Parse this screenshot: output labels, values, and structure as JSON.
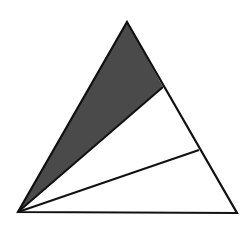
{
  "diagram": {
    "colors": {
      "stroke": "#111111",
      "shaded_fill": "#4a4a4a",
      "unshaded_fill": "#ffffff",
      "background": "#ffffff"
    },
    "vertices": {
      "apex": [
        127,
        22
      ],
      "bottom_left": [
        18,
        212
      ],
      "bottom_right": [
        237,
        213
      ]
    },
    "division_points": [
      [
        163,
        87
      ],
      [
        199,
        150
      ]
    ],
    "regions": [
      {
        "name": "shaded-region",
        "shaded": true,
        "points": "18,212 127,22 163,87"
      },
      {
        "name": "middle-region",
        "shaded": false,
        "points": "18,212 163,87 199,150"
      },
      {
        "name": "bottom-region",
        "shaded": false,
        "points": "18,212 199,150 237,213"
      }
    ]
  }
}
